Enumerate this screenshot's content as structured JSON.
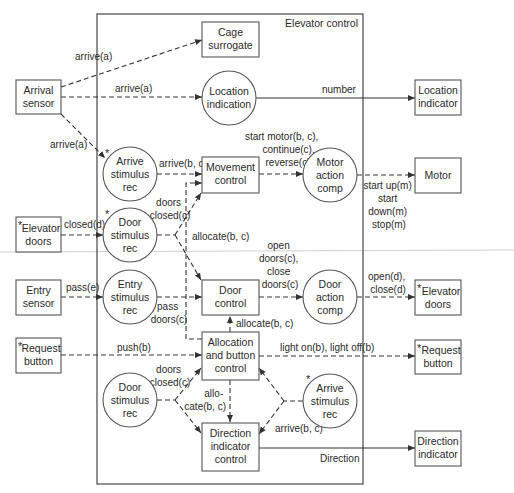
{
  "diagram": {
    "title": "Elevator control",
    "external_entities": {
      "arrival_sensor": [
        "Arrival",
        "sensor"
      ],
      "elevator_doors_in": [
        "Elevator",
        "doors"
      ],
      "entry_sensor": [
        "Entry",
        "sensor"
      ],
      "request_button_in": [
        "Request",
        "button"
      ],
      "location_indicator": [
        "Location",
        "indicator"
      ],
      "motor": [
        "Motor"
      ],
      "elevator_doors_out": [
        "Elevator",
        "doors"
      ],
      "request_button_out": [
        "Request",
        "button"
      ],
      "direction_indicator": [
        "Direction",
        "indicator"
      ]
    },
    "control_boxes": {
      "cage_surrogate": [
        "Cage",
        "surrogate"
      ],
      "movement_control": [
        "Movement",
        "control"
      ],
      "door_control": [
        "Door",
        "control"
      ],
      "allocation_button_control": [
        "Allocation",
        "and button",
        "control"
      ],
      "direction_indicator_control": [
        "Direction",
        "indicator",
        "control"
      ]
    },
    "processes": {
      "location_indication": [
        "Location",
        "indication"
      ],
      "arrive_stimulus_rec_top": [
        "Arrive",
        "stimulus",
        "rec"
      ],
      "door_stimulus_rec_top": [
        "Door",
        "stimulus",
        "rec"
      ],
      "entry_stimulus_rec": [
        "Entry",
        "stimulus",
        "rec"
      ],
      "motor_action_comp": [
        "Motor",
        "action",
        "comp"
      ],
      "door_action_comp": [
        "Door",
        "action",
        "comp"
      ],
      "door_stimulus_rec_bottom": [
        "Door",
        "stimulus",
        "rec"
      ],
      "arrive_stimulus_rec_bottom": [
        "Arrive",
        "stimulus",
        "rec"
      ]
    },
    "multiplicity_marker": "*",
    "flows": {
      "arrive_a_cage": "arrive(a)",
      "arrive_a_location": "arrive(a)",
      "arrive_a_stimulus": "arrive(a)",
      "number": "number",
      "arrive_bc_movement": "arrive(b, c)",
      "start_motor": [
        "start motor(b, c),",
        "continue(c),",
        "reverse(c)"
      ],
      "motor_commands": [
        "start up(m)",
        "start",
        "down(m)",
        "stop(m)"
      ],
      "closed_d": "closed(d)",
      "doors_closed_top": [
        "doors",
        "closed(c)"
      ],
      "allocate_bc_mid": "allocate(b, c)",
      "pass_e": "pass(e)",
      "pass_doors": [
        "pass",
        "doors(c)"
      ],
      "open_close_doors": [
        "open",
        "doors(c),",
        "close",
        "doors(c)"
      ],
      "open_close_d": [
        "open(d),",
        "close(d)"
      ],
      "allocate_bc_up": "allocate(b, c)",
      "push_b": "push(b)",
      "light_on_off": "light on(b), light off(b)",
      "doors_closed_bottom": [
        "doors",
        "closed(c)"
      ],
      "allocate_bc_down": [
        "allo-",
        "cate(b, c)"
      ],
      "arrive_bc_bottom": "arrive(b, c)",
      "direction": "Direction"
    }
  }
}
